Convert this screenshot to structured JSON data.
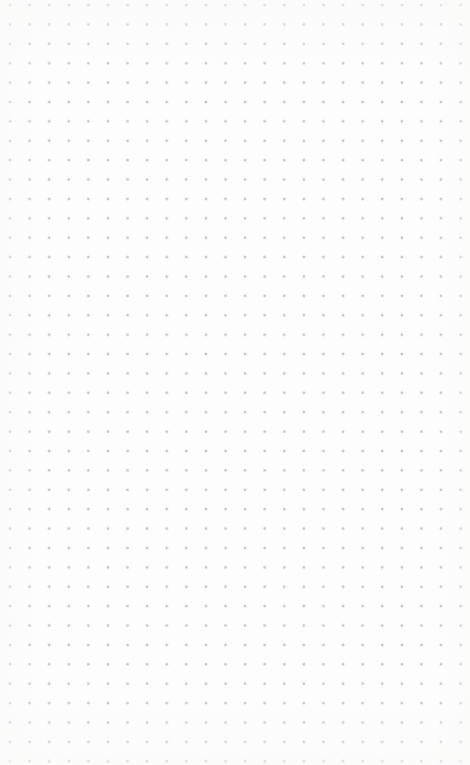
{
  "canvas": {
    "width": 470,
    "height": 765,
    "background_color": "#fdfdfd",
    "surface_label": "",
    "state": "empty"
  },
  "dot_grid": {
    "dot_color": "#c6c6cb",
    "dot_radius_px": 1,
    "spacing_x_px": 19.6,
    "spacing_y_px": 19.4,
    "origin_x_px": 10,
    "origin_y_px": 5,
    "columns": 24,
    "rows": 40
  },
  "overlays": {
    "tint_color": "#faf9f8"
  }
}
